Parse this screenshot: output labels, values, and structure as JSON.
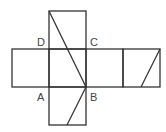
{
  "diagram": {
    "type": "cube-net",
    "stroke_color": "#333333",
    "label_color": "#444444",
    "labels": {
      "D": "D",
      "C": "C",
      "A": "A",
      "B": "B"
    }
  }
}
